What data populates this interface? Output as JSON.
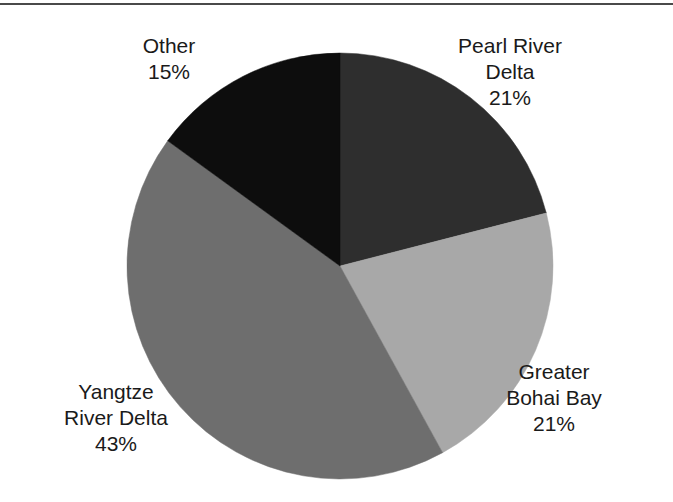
{
  "figure": {
    "width": 673,
    "height": 502,
    "background": "#ffffff",
    "rule_color": "#4a4a4a"
  },
  "chart_data": {
    "type": "pie",
    "title": "",
    "subtitle": "",
    "xlabel": "",
    "ylabel": "",
    "legend_position": "none",
    "grid": false,
    "labels_position": "outside",
    "value_suffix": "%",
    "start_angle_deg": 0,
    "direction": "clockwise",
    "center": {
      "x": 340,
      "y": 266
    },
    "radius": 213,
    "categories": [
      "Pearl River Delta",
      "Greater Bohai Bay",
      "Yangtze River Delta",
      "Other"
    ],
    "values": [
      21,
      21,
      43,
      15
    ],
    "colors": [
      "#2e2e2e",
      "#a8a8a8",
      "#6e6e6e",
      "#0d0d0d"
    ],
    "slices": [
      {
        "name": "Pearl River Delta",
        "value": 21,
        "value_text": "21%",
        "color": "#2e2e2e",
        "start_deg": 0,
        "end_deg": 75.6,
        "label_lines": [
          "Pearl River",
          "Delta",
          "21%"
        ]
      },
      {
        "name": "Greater Bohai Bay",
        "value": 21,
        "value_text": "21%",
        "color": "#a8a8a8",
        "start_deg": 75.6,
        "end_deg": 151.2,
        "label_lines": [
          "Greater",
          "Bohai Bay",
          "21%"
        ]
      },
      {
        "name": "Yangtze River Delta",
        "value": 43,
        "value_text": "43%",
        "color": "#6e6e6e",
        "start_deg": 151.2,
        "end_deg": 306.0,
        "label_lines": [
          "Yangtze",
          "River Delta",
          "43%"
        ]
      },
      {
        "name": "Other",
        "value": 15,
        "value_text": "15%",
        "color": "#0d0d0d",
        "start_deg": 306.0,
        "end_deg": 360.0,
        "label_lines": [
          "Other",
          "15%"
        ]
      }
    ]
  },
  "labels": {
    "other": {
      "line1": "Other",
      "line2": "15%"
    },
    "pearl": {
      "line1": "Pearl River",
      "line2": "Delta",
      "line3": "21%"
    },
    "bohai": {
      "line1": "Greater",
      "line2": "Bohai Bay",
      "line3": "21%"
    },
    "yangtze": {
      "line1": "Yangtze",
      "line2": "River Delta",
      "line3": "43%"
    }
  }
}
